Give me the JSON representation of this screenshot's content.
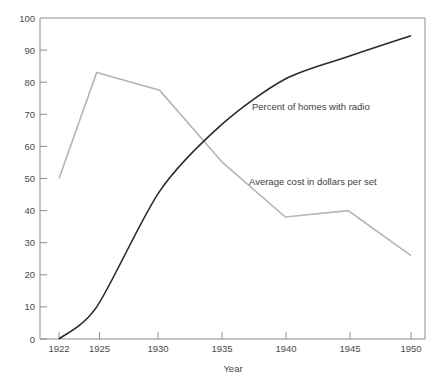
{
  "chart_data": {
    "type": "line",
    "title": "",
    "subtitle": "",
    "xlabel": "Year",
    "ylabel": "",
    "x": [
      1922,
      1925,
      1930,
      1935,
      1940,
      1945,
      1950
    ],
    "xtick_labels": [
      "1922",
      "1925",
      "1930",
      "1935",
      "1940",
      "1945",
      "1950"
    ],
    "ytick_labels": [
      "0",
      "10",
      "20",
      "30",
      "40",
      "50",
      "60",
      "70",
      "80",
      "90",
      "100"
    ],
    "yticks": [
      0,
      10,
      20,
      30,
      40,
      50,
      60,
      70,
      80,
      90,
      100
    ],
    "ylim": [
      0,
      100
    ],
    "xlim": [
      1922,
      1951.6
    ],
    "grid": false,
    "legend_position": "inline-annotation",
    "series": [
      {
        "name": "Percent of homes with radio",
        "color": "#2a2a2a",
        "values": [
          0,
          10,
          46,
          67,
          81,
          88,
          94.5
        ],
        "annotation": {
          "text": "Percent of homes with radio",
          "x_px": 252,
          "y_px": 110
        }
      },
      {
        "name": "Average cost in dollars per set",
        "color": "#b4b4b4",
        "values": [
          50,
          83,
          77.5,
          55,
          38,
          40,
          26
        ],
        "annotation": {
          "text": "Average cost in dollars per set",
          "x_px": 249,
          "y_px": 185
        }
      }
    ]
  },
  "figure": {
    "background": "#ffffff",
    "frame_color": "#8d8d8d",
    "text_color": "#4a4a4a",
    "axis_title_x": "Year"
  }
}
